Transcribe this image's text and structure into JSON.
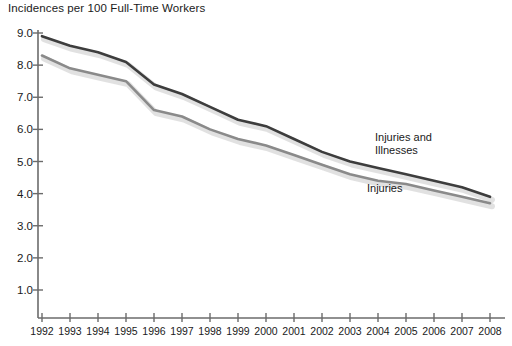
{
  "chart_data": {
    "type": "line",
    "title": "Incidences per 100 Full-Time Workers",
    "xlabel": "",
    "ylabel": "",
    "grid": false,
    "legend_position": "inline-annotations",
    "x": [
      1992,
      1993,
      1994,
      1995,
      1996,
      1997,
      1998,
      1999,
      2000,
      2001,
      2002,
      2003,
      2004,
      2005,
      2006,
      2007,
      2008
    ],
    "categories": [
      "1992",
      "1993",
      "1994",
      "1995",
      "1996",
      "1997",
      "1998",
      "1999",
      "2000",
      "2001",
      "2002",
      "2003",
      "2004",
      "2005",
      "2006",
      "2007",
      "2008"
    ],
    "xlim": [
      1992,
      2008
    ],
    "ylim": [
      0.0,
      9.0
    ],
    "yticks": [
      "9.0",
      "8.0",
      "7.0",
      "6.0",
      "5.0",
      "4.0",
      "3.0",
      "2.0",
      "1.0"
    ],
    "ytick_values": [
      9.0,
      8.0,
      7.0,
      6.0,
      5.0,
      4.0,
      3.0,
      2.0,
      1.0
    ],
    "series": [
      {
        "name": "Injuries and Illnesses",
        "color": "#3d3d3d",
        "values": [
          8.9,
          8.6,
          8.4,
          8.1,
          7.4,
          7.1,
          6.7,
          6.3,
          6.1,
          5.7,
          5.3,
          5.0,
          4.8,
          4.6,
          4.4,
          4.2,
          3.9
        ]
      },
      {
        "name": "Injuries",
        "color": "#8a8a8a",
        "values": [
          8.3,
          7.9,
          7.7,
          7.5,
          6.6,
          6.4,
          6.0,
          5.7,
          5.5,
          5.2,
          4.9,
          4.6,
          4.4,
          4.3,
          4.1,
          3.9,
          3.7
        ]
      }
    ],
    "annotations": [
      {
        "text": "Injuries and\nIllnesses",
        "series": "Injuries and Illnesses"
      },
      {
        "text": "Injuries",
        "series": "Injuries"
      }
    ]
  },
  "colors": {
    "axis": "#6b6b6b",
    "text": "#1a1a1a",
    "series_dark": "#3d3d3d",
    "series_light": "#8a8a8a",
    "shadow": "#c9c9c9",
    "background": "#ffffff"
  }
}
